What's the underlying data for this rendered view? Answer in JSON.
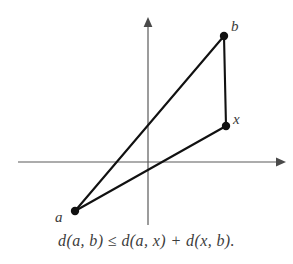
{
  "figure": {
    "name": "triangle-inequality-diagram",
    "background_color": "#ffffff",
    "caption": "d(a, b) ≤ d(a, x) + d(x, b).",
    "axes": {
      "color": "#5a5a5a",
      "stroke_width": 1.2,
      "x_axis": {
        "name": "x-axis",
        "from": [
          18,
          162
        ],
        "to": [
          285,
          162
        ],
        "arrowhead": "right"
      },
      "y_axis": {
        "name": "y-axis",
        "from": [
          148,
          225
        ],
        "to": [
          148,
          17
        ],
        "arrowhead": "up"
      },
      "origin": [
        148,
        162
      ]
    },
    "points": [
      {
        "id": "a",
        "label": "a",
        "x": 75,
        "y": 211,
        "radius": 4.2,
        "color": "#111111"
      },
      {
        "id": "b",
        "label": "b",
        "x": 224,
        "y": 36,
        "radius": 4.2,
        "color": "#111111"
      },
      {
        "id": "x",
        "label": "x",
        "x": 226,
        "y": 126,
        "radius": 4.2,
        "color": "#111111"
      }
    ],
    "segments": [
      {
        "id": "segment-a-b",
        "from": "a",
        "to": "b",
        "color": "#111111",
        "stroke_width": 2.1
      },
      {
        "id": "segment-a-x",
        "from": "a",
        "to": "x",
        "color": "#111111",
        "stroke_width": 2.1
      },
      {
        "id": "segment-x-b",
        "from": "x",
        "to": "b",
        "color": "#111111",
        "stroke_width": 2.1
      }
    ]
  }
}
